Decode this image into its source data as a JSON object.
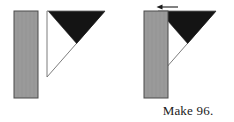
{
  "figure": {
    "type": "quilt-piecing-instruction-diagram",
    "caption": "Make 96.",
    "background_color": "#ffffff",
    "colors": {
      "fabric_gray": "#9a9a9a",
      "fabric_gray_outline": "#4a4a4a",
      "fabric_black": "#141414",
      "triangle_outline": "#6e6e6e",
      "arrow": "#1a1a1a",
      "caption_text": "#1a1a1a"
    },
    "panels": [
      {
        "name": "before-panel",
        "label": "",
        "pieces": [
          {
            "name": "gray-rectangle-strip",
            "shape": "rectangle",
            "fill": "#9a9a9a",
            "x": 14,
            "y": 11,
            "width": 24,
            "height": 87
          },
          {
            "name": "white-triangle-unit",
            "shape": "right-triangle",
            "fill": "#ffffff",
            "points": "47,11 105,11 47,77"
          },
          {
            "name": "black-triangle-unit",
            "shape": "triangle",
            "fill": "#141414",
            "points": "49,11 105,11 77,43"
          }
        ]
      },
      {
        "name": "after-panel",
        "label": "",
        "pieces": [
          {
            "name": "white-triangle-unit",
            "shape": "right-triangle",
            "fill": "#ffffff",
            "points": "158,11 216,11 158,77"
          },
          {
            "name": "black-triangle-unit",
            "shape": "triangle",
            "fill": "#141414",
            "points": "160,11 216,11 188,43"
          },
          {
            "name": "gray-rectangle-strip",
            "shape": "rectangle",
            "fill": "#9a9a9a",
            "x": 144,
            "y": 11,
            "width": 24,
            "height": 87
          },
          {
            "name": "seam-direction-arrow",
            "shape": "arrow",
            "direction": "left",
            "x1": 178,
            "x2": 157,
            "y": 7
          }
        ]
      }
    ]
  }
}
